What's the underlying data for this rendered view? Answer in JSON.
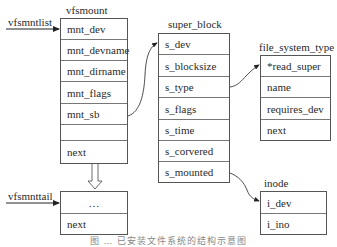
{
  "labels": {
    "vfsmntlist": "vfsmntlist",
    "vfsmnttail": "vfsmnttail",
    "vfsmount": "vfsmount",
    "super_block": "super_block",
    "file_system_type": "file_system_type",
    "inode": "inode"
  },
  "vfsmount": {
    "rows": [
      "mnt_dev",
      "mnt_devname",
      "mnt_dirname",
      "mnt_flags",
      "mnt_sb",
      "",
      "next"
    ]
  },
  "vfsmount_tail": {
    "rows": [
      "…",
      "next"
    ]
  },
  "super_block": {
    "rows": [
      "s_dev",
      "s_blocksize",
      "s_type",
      "s_flags",
      "s_time",
      "s_corvered",
      "s_mounted"
    ]
  },
  "file_system_type": {
    "rows": [
      "*read_super",
      "name",
      "requires_dev",
      "next"
    ]
  },
  "inode": {
    "rows": [
      "i_dev",
      "i_ino"
    ]
  },
  "caption": "图 … 已安装文件系统的结构示意图"
}
